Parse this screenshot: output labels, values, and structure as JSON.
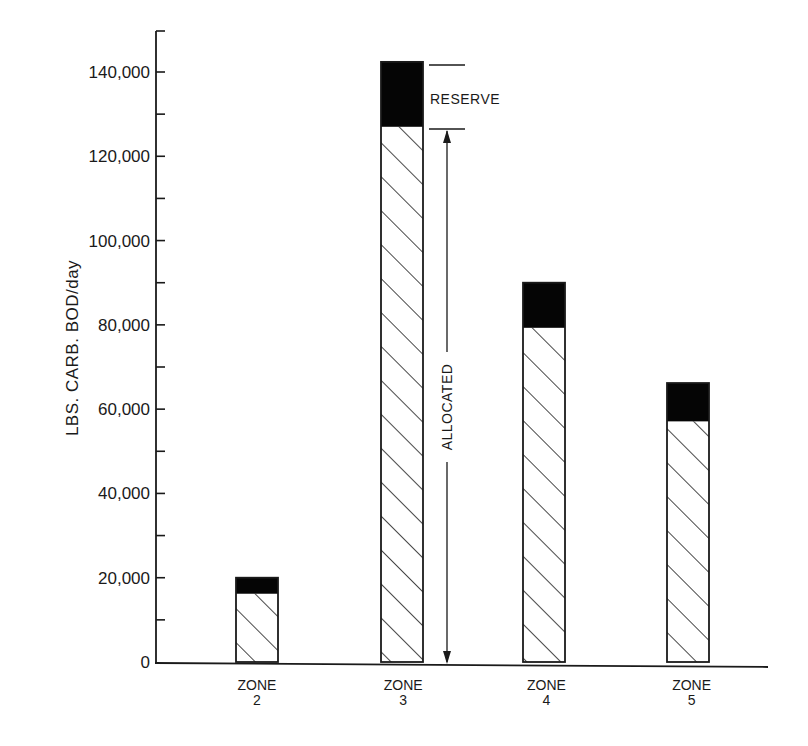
{
  "chart_data": {
    "type": "bar",
    "stacked": true,
    "title": "",
    "xlabel": "",
    "ylabel": "LBS. CARB. BOD/day",
    "categories": [
      "ZONE 2",
      "ZONE 3",
      "ZONE 4",
      "ZONE 5"
    ],
    "category_lines": [
      [
        "ZONE",
        "2"
      ],
      [
        "ZONE",
        "3"
      ],
      [
        "ZONE",
        "4"
      ],
      [
        "ZONE",
        "5"
      ]
    ],
    "series": [
      {
        "name": "ALLOCATED",
        "pattern": "diagonal-hatch",
        "values": [
          16200,
          127000,
          79300,
          57100
        ]
      },
      {
        "name": "RESERVE",
        "color": "#000000",
        "values": [
          3800,
          15400,
          10700,
          9100
        ]
      }
    ],
    "totals": [
      20000,
      142400,
      90000,
      66200
    ],
    "ylim": [
      0,
      150000
    ],
    "yticks": [
      0,
      20000,
      40000,
      60000,
      80000,
      100000,
      120000,
      140000
    ],
    "ytick_labels": [
      "0",
      "20,000",
      "40,000",
      "60,000",
      "80,000",
      "100,000",
      "120,000",
      "140,000"
    ],
    "minor_ytick_step": 10000,
    "grid": false,
    "legend": "none",
    "annotations": [
      {
        "text": "RESERVE",
        "target": "ZONE 3 reserve segment"
      },
      {
        "text": "ALLOCATED",
        "target": "ZONE 3 allocated segment (dimension arrow)"
      }
    ]
  },
  "labels": {
    "ylabel": "LBS. CARB. BOD/day",
    "reserve": "RESERVE",
    "allocated": "ALLOCATED",
    "yticks": [
      "0",
      "20,000",
      "40,000",
      "60,000",
      "80,000",
      "100,000",
      "120,000",
      "140,000"
    ],
    "zones": [
      {
        "line1": "ZONE",
        "line2": "2"
      },
      {
        "line1": "ZONE",
        "line2": "3"
      },
      {
        "line1": "ZONE",
        "line2": "4"
      },
      {
        "line1": "ZONE",
        "line2": "5"
      }
    ]
  }
}
